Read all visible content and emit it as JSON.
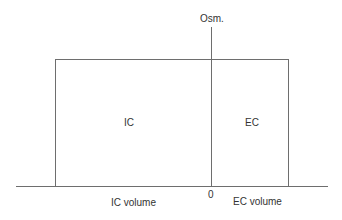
{
  "diagram": {
    "type": "osmolarity-volume diagram (Darrow-Yannet style)",
    "y_axis_label": "Osm.",
    "origin_label": "0",
    "compartments": [
      {
        "label": "IC",
        "x_label": "IC volume"
      },
      {
        "label": "EC",
        "x_label": "EC volume"
      }
    ]
  },
  "colors": {
    "line": "#6e6e6e",
    "text": "#333333",
    "background": "#ffffff"
  }
}
